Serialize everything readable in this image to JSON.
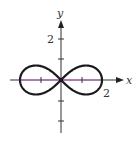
{
  "figure": {
    "title": "",
    "axes": {
      "x_label": "x",
      "y_label": "y",
      "x_tick_label": "2",
      "y_tick_label": "2"
    },
    "colors": {
      "curve": "#1a1a1a",
      "axis": "#333333",
      "highlight_axis": "#c060c0",
      "background": "#ffffff"
    }
  },
  "chart_data": {
    "type": "line",
    "title": "",
    "xlabel": "x",
    "ylabel": "y",
    "curve": "lemniscate r^2 = 4cos(2θ)",
    "parameter_a": 2,
    "x_ticks": [
      -2,
      -1,
      1,
      2
    ],
    "y_ticks": [
      -2,
      -1,
      1,
      2
    ],
    "labeled_ticks": {
      "x": [
        2
      ],
      "y": [
        2
      ]
    },
    "xlim": [
      -2.5,
      3
    ],
    "ylim": [
      -2.5,
      3.5
    ],
    "grid": false,
    "legend": "none"
  }
}
